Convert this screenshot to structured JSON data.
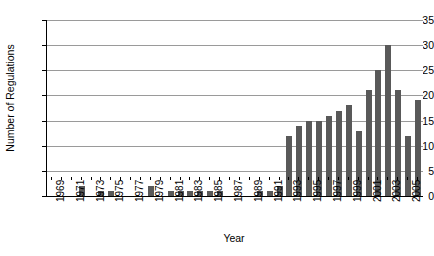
{
  "chart_data": {
    "type": "bar",
    "title": "",
    "xlabel": "Year",
    "ylabel": "Number of Regulations",
    "ylim": [
      0,
      35
    ],
    "ytick_step": 5,
    "yticks": [
      0,
      5,
      10,
      15,
      20,
      25,
      30,
      35
    ],
    "grid": true,
    "legend": "none",
    "bar_color": "#595959",
    "axis_color": "#000000",
    "gridline_color": "#9a9a9a",
    "background": "#ffffff",
    "xtick_label_rotation": -90,
    "xtick_labels_shown": [
      "1969",
      "1971",
      "1973",
      "1975",
      "1977",
      "1979",
      "1981",
      "1983",
      "1985",
      "1987",
      "1989",
      "1991",
      "1993",
      "1995",
      "1997",
      "1999",
      "2001",
      "2003",
      "2005"
    ],
    "categories": [
      "1969",
      "1970",
      "1971",
      "1972",
      "1973",
      "1974",
      "1975",
      "1976",
      "1977",
      "1978",
      "1979",
      "1980",
      "1981",
      "1982",
      "1983",
      "1984",
      "1985",
      "1986",
      "1987",
      "1988",
      "1989",
      "1990",
      "1991",
      "1992",
      "1993",
      "1994",
      "1995",
      "1996",
      "1997",
      "1998",
      "1999",
      "2000",
      "2001",
      "2002",
      "2003",
      "2004",
      "2005",
      "2006"
    ],
    "values": [
      0,
      0,
      0,
      2,
      0,
      1,
      1,
      0,
      0,
      0,
      2,
      0,
      1,
      1,
      1,
      1,
      1,
      1,
      0,
      0,
      0,
      1,
      1,
      2,
      12,
      14,
      15,
      15,
      16,
      17,
      18,
      13,
      21,
      25,
      30,
      21,
      12,
      19
    ]
  }
}
